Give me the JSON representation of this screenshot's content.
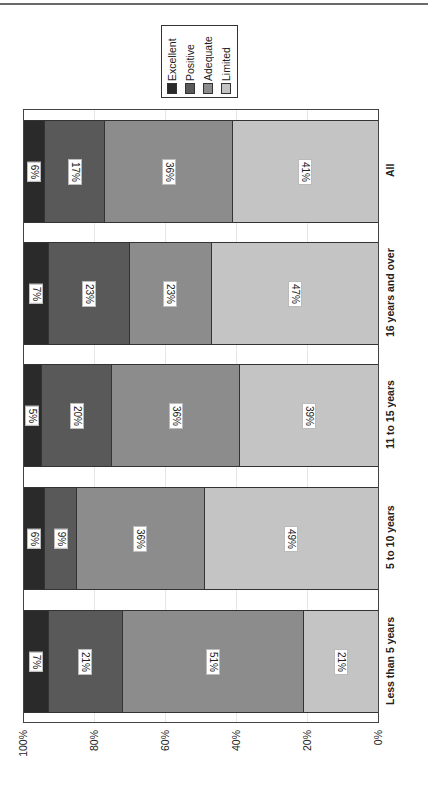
{
  "chart_data": {
    "type": "bar",
    "orientation": "horizontal-stacked-100 (page rotated 90°)",
    "categories": [
      "All",
      "16 years and over",
      "11 to 15 years",
      "5 to 10 years",
      "Less than 5 years"
    ],
    "series": [
      {
        "name": "Excellent",
        "color": "#2a2a2a",
        "values": [
          6,
          7,
          5,
          6,
          7
        ]
      },
      {
        "name": "Positive",
        "color": "#595959",
        "values": [
          17,
          23,
          20,
          9,
          21
        ]
      },
      {
        "name": "Adequate",
        "color": "#8c8c8c",
        "values": [
          36,
          23,
          36,
          36,
          51
        ]
      },
      {
        "name": "Limited",
        "color": "#c4c4c4",
        "values": [
          41,
          47,
          39,
          49,
          21
        ]
      }
    ],
    "labels": [
      [
        "6%",
        "17%",
        "36%",
        "41%"
      ],
      [
        "7%",
        "23%",
        "23%",
        "47%"
      ],
      [
        "5%",
        "20%",
        "36%",
        "39%"
      ],
      [
        "6%",
        "9%",
        "36%",
        "49%"
      ],
      [
        "7%",
        "21%",
        "51%",
        "21%"
      ]
    ],
    "title": "",
    "xlabel": "",
    "ylabel": "",
    "ylim": [
      0,
      100
    ],
    "ticks": [
      "100%",
      "80%",
      "60%",
      "40%",
      "20%",
      "0%"
    ],
    "grid": true,
    "legend_position": "top"
  },
  "legend": {
    "items": [
      {
        "label": "Excellent",
        "color": "#2a2a2a"
      },
      {
        "label": "Positive",
        "color": "#595959"
      },
      {
        "label": "Adequate",
        "color": "#8c8c8c"
      },
      {
        "label": "Limited",
        "color": "#c4c4c4"
      }
    ]
  },
  "axis": {
    "ticks": [
      "100%",
      "80%",
      "60%",
      "40%",
      "20%",
      "0%"
    ]
  },
  "categories": [
    {
      "label": "All"
    },
    {
      "label": "16 years and over"
    },
    {
      "label": "11 to 15 years"
    },
    {
      "label": "5 to 10 years"
    },
    {
      "label": "Less than 5 years"
    }
  ]
}
